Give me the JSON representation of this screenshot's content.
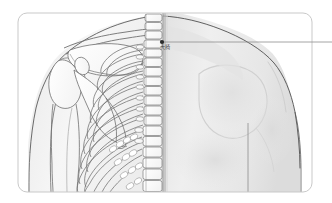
{
  "figure": {
    "frame": {
      "shape": "rounded-rectangle",
      "x": 18,
      "y": 13,
      "width": 294,
      "height": 179,
      "radius": 9,
      "stroke_color": "#c9c9c9"
    },
    "halves": {
      "left": {
        "name": "skeletal-half",
        "description": "scapula, clavicle, humerus, ribcage, vertebral column"
      },
      "right": {
        "name": "surface-half",
        "description": "shaded skin and muscle contour of back and shoulder"
      }
    },
    "midline_x": 163
  },
  "annotation": {
    "point": {
      "label": "大椅",
      "romanization": "Dazhui",
      "marker_x": 162,
      "marker_y": 42,
      "marker_color": "#2b2b2b",
      "label_x": 160,
      "label_y": 46
    },
    "leader_line": {
      "from_x": 162,
      "from_y": 42,
      "to_x": 332,
      "to_y": 42,
      "color": "#8e8e8e"
    }
  },
  "colors": {
    "background": "#ffffff",
    "frame_stroke": "#c9c9c9",
    "bone_outline": "#6f6f6f",
    "bone_fill": "#fbfbfb",
    "skin_light": "#f2f2f2",
    "skin_mid": "#e4e4e4",
    "skin_dark": "#d2d2d2",
    "body_outline": "#4f4f4f",
    "label_text": "#4a4a4a"
  }
}
